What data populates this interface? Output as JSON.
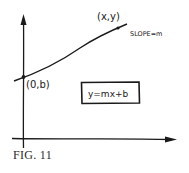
{
  "figure": {
    "caption": "FIG. 11",
    "equation": "y=mx+b",
    "point_intercept_label": "(0,b)",
    "point_general_label": "(x,y)",
    "slope_label": "SLOPE=m",
    "ink_color": "#1a1a1a",
    "background": "#ffffff"
  }
}
